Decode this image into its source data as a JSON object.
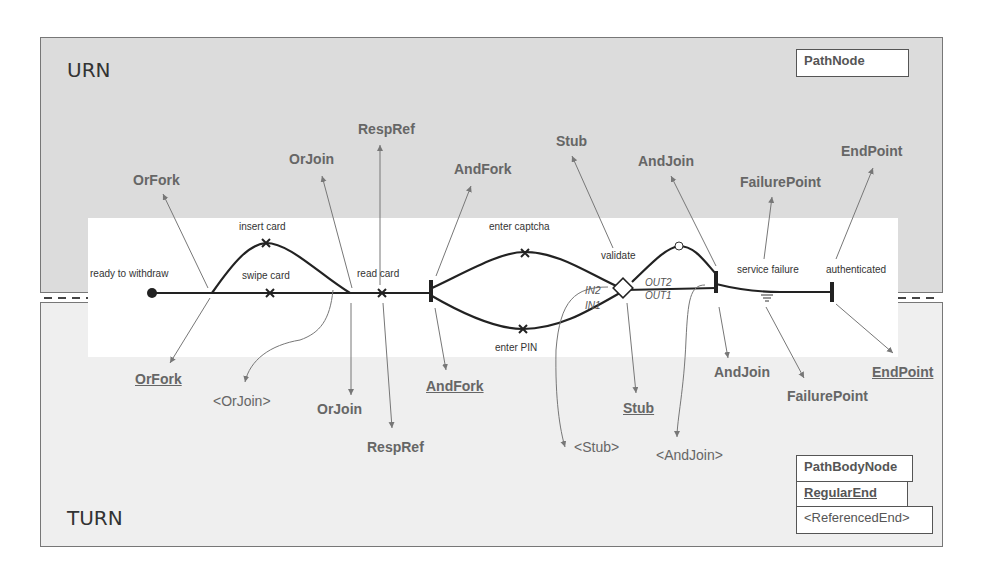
{
  "layers": {
    "urn": {
      "title": "URN",
      "background": "#dcdcdc"
    },
    "turn": {
      "title": "TURN",
      "background": "#efefef"
    }
  },
  "metaclass_boxes": {
    "path_node": "PathNode",
    "path_body_node": "PathBodyNode",
    "regular_end": "RegularEnd",
    "referenced_end": "<ReferencedEnd>"
  },
  "path_labels": {
    "start": "ready to withdraw",
    "insert_card": "insert card",
    "swipe_card": "swipe card",
    "read_card": "read card",
    "enter_captcha": "enter captcha",
    "enter_pin": "enter PIN",
    "validate": "validate",
    "service_failure": "service failure",
    "authenticated": "authenticated"
  },
  "ports": {
    "in2": "IN2",
    "in1": "IN1",
    "out2": "OUT2",
    "out1": "OUT1"
  },
  "urn_labels": {
    "orfork": "OrFork",
    "orjoin": "OrJoin",
    "respref": "RespRef",
    "andfork": "AndFork",
    "stub": "Stub",
    "andjoin": "AndJoin",
    "failurepoint": "FailurePoint",
    "endpoint": "EndPoint"
  },
  "turn_labels": {
    "orfork": "OrFork",
    "orjoin_ref": "<OrJoin>",
    "orjoin": "OrJoin",
    "respref": "RespRef",
    "andfork": "AndFork",
    "stub_ref": "<Stub>",
    "stub": "Stub",
    "andjoin_ref": "<AndJoin>",
    "andjoin": "AndJoin",
    "failurepoint": "FailurePoint",
    "endpoint": "EndPoint"
  },
  "colors": {
    "path": "#222222",
    "arrow": "#777777",
    "label": "#666666"
  }
}
